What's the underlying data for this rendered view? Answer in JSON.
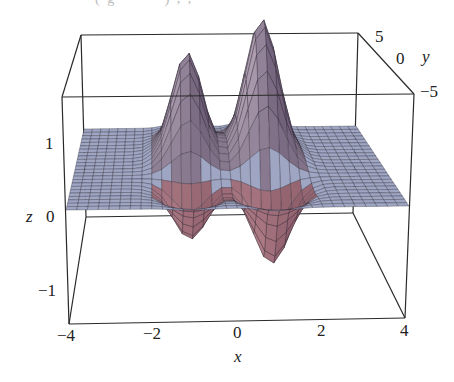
{
  "caption_fragment": "( g  — —   )  ,  ,  —  —",
  "chart_data": {
    "type": "surface3d",
    "title": "",
    "function_description": "Surface with two peaks (near x = -1 and x = +1, back half y > 0) and two dips (front half y < 0), flat at z = 0 elsewhere",
    "xlabel": "x",
    "ylabel": "y",
    "zlabel": "z",
    "xlim": [
      -4,
      4
    ],
    "ylim": [
      -5,
      5
    ],
    "zlim": [
      -1.5,
      1.5
    ],
    "x_ticks": [
      "−4",
      "−2",
      "0",
      "2",
      "4"
    ],
    "y_ticks": [
      "5",
      "0",
      "−5"
    ],
    "z_ticks": [
      "1",
      "0",
      "−1"
    ],
    "grid": false,
    "box": true,
    "mesh": {
      "nx": 32,
      "ny": 24
    },
    "colors": {
      "plane": "#9ea6c4",
      "peak": "#b9a9ba",
      "peak_shadow": "#6f5f78",
      "dip": "#b98891",
      "dip_shadow": "#7a4a5a",
      "mesh_line": "#2b2530",
      "frame": "#2a2a2a"
    }
  },
  "labels": {
    "x": "x",
    "y": "y",
    "z": "z"
  }
}
